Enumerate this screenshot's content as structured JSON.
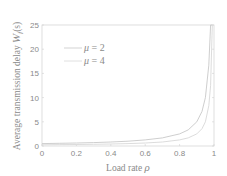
{
  "chart_data": {
    "type": "line",
    "title": "",
    "xlabel": "Load rate ρ",
    "ylabel": "Average transmission delay W_f(s)",
    "xlim": [
      0,
      1
    ],
    "ylim": [
      0,
      25
    ],
    "xticks": [
      "0",
      "0.2",
      "0.4",
      "0.6",
      "0.8",
      "1"
    ],
    "yticks": [
      "0",
      "5",
      "10",
      "15",
      "20",
      "25"
    ],
    "grid": false,
    "legend_position": "upper left",
    "series": [
      {
        "name": "μ = 2",
        "color": "#c8c8c8",
        "x": [
          0,
          0.1,
          0.2,
          0.3,
          0.4,
          0.5,
          0.6,
          0.7,
          0.8,
          0.85,
          0.9,
          0.93,
          0.95,
          0.97,
          0.98,
          0.99
        ],
        "y": [
          0.5,
          0.56,
          0.63,
          0.71,
          0.83,
          1.0,
          1.25,
          1.67,
          2.5,
          3.33,
          5.0,
          7.14,
          10.0,
          16.7,
          25.0,
          25.0
        ]
      },
      {
        "name": "μ = 4",
        "color": "#d8d8d8",
        "x": [
          0,
          0.1,
          0.2,
          0.3,
          0.4,
          0.5,
          0.6,
          0.7,
          0.8,
          0.85,
          0.9,
          0.93,
          0.95,
          0.97,
          0.98,
          0.99
        ],
        "y": [
          0.25,
          0.28,
          0.31,
          0.36,
          0.42,
          0.5,
          0.63,
          0.83,
          1.25,
          1.67,
          2.5,
          3.57,
          5.0,
          8.33,
          12.5,
          25.0
        ]
      }
    ]
  },
  "legend": {
    "entries": [
      {
        "symbol": "μ",
        "eq": " = 2"
      },
      {
        "symbol": "μ",
        "eq": " = 4"
      }
    ]
  },
  "axes": {
    "xlabel_text": "Load rate ",
    "xlabel_symbol": "ρ",
    "ylabel_text": "Average transmission delay ",
    "ylabel_symbol": "W",
    "ylabel_sub": "f",
    "ylabel_unit": "(s)"
  }
}
